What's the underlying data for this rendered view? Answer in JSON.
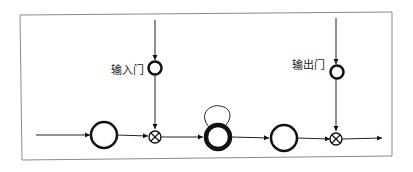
{
  "diagram": {
    "type": "lstm-gate-flow",
    "labels": {
      "input_gate": "输入门",
      "output_gate": "输出门"
    },
    "nodes": [
      {
        "id": "input",
        "kind": "neuron"
      },
      {
        "id": "input-gate-multiply",
        "kind": "multiply",
        "symbol": "⊗"
      },
      {
        "id": "memory-cell",
        "kind": "neuron-bold",
        "self_loop": true
      },
      {
        "id": "output",
        "kind": "neuron"
      },
      {
        "id": "output-gate-multiply",
        "kind": "multiply",
        "symbol": "⊗"
      }
    ],
    "gates": [
      {
        "id": "input-gate",
        "label_ref": "input_gate",
        "controls": "input-gate-multiply"
      },
      {
        "id": "output-gate",
        "label_ref": "output_gate",
        "controls": "output-gate-multiply"
      }
    ],
    "colors": {
      "stroke": "#111111",
      "frame": "#888888",
      "background": "#ffffff"
    }
  }
}
